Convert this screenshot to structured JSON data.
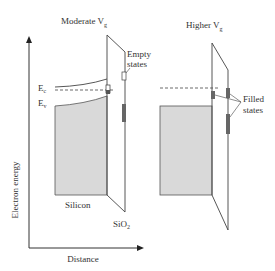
{
  "diagram": {
    "left_panel": {
      "title_prefix": "Moderate V",
      "title_sub": "g",
      "ec_label": "E",
      "ec_sub": "c",
      "ev_label": "E",
      "ev_sub": "v",
      "empty_states_line1": "Empty",
      "empty_states_line2": "states",
      "silicon_label": "Silicon",
      "oxide_label": "SiO",
      "oxide_sub": "2"
    },
    "right_panel": {
      "title_prefix": "Higher V",
      "title_sub": "g",
      "filled_states_line1": "Filled",
      "filled_states_line2": "states"
    },
    "axes": {
      "y_label": "Electron energy",
      "x_label": "Distance"
    },
    "colors": {
      "silicon_fill": "#d9d9d9",
      "line": "#444444",
      "state_fill": "#666666"
    }
  }
}
